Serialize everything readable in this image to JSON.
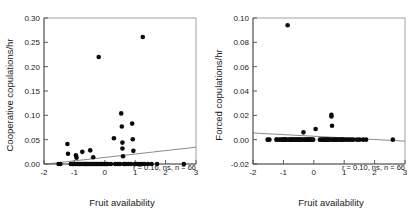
{
  "figure": {
    "background": "#ffffff",
    "point_color": "#0a0a0a",
    "line_color": "#6d6d6d",
    "frame_color": "#8a8a8a"
  },
  "chart_data": [
    {
      "type": "scatter",
      "panel": "left",
      "title": "",
      "xlabel": "Fruit availability",
      "ylabel": "Cooperative copulations/hr",
      "xlim": [
        -2,
        3
      ],
      "ylim": [
        0.0,
        0.3
      ],
      "xticks": [
        -2,
        -1,
        0,
        1,
        2,
        3
      ],
      "xticklabels": [
        "-2",
        "-1",
        "0",
        "1",
        "2",
        "3"
      ],
      "yticks": [
        0.0,
        0.05,
        0.1,
        0.15,
        0.2,
        0.25,
        0.3
      ],
      "yticklabels": [
        "0.00",
        "0.05",
        "0.10",
        "0.15",
        "0.20",
        "0.25",
        "0.30"
      ],
      "grid": false,
      "legend": null,
      "annotation": "r = 0.16, ns, n = 66",
      "annotation_stats": {
        "r": 0.16,
        "significance": "ns",
        "n": 66
      },
      "trendline": {
        "x": [
          -2.0,
          3.0
        ],
        "y": [
          -0.0005,
          0.0345
        ]
      },
      "points": [
        [
          -1.52,
          0.0
        ],
        [
          -1.46,
          0.0
        ],
        [
          -1.23,
          0.041
        ],
        [
          -1.21,
          0.021
        ],
        [
          -1.12,
          0.0
        ],
        [
          -1.06,
          0.0
        ],
        [
          -1.02,
          0.0
        ],
        [
          -0.98,
          0.0
        ],
        [
          -0.95,
          0.018
        ],
        [
          -0.93,
          0.013
        ],
        [
          -0.9,
          0.0
        ],
        [
          -0.86,
          0.0
        ],
        [
          -0.82,
          0.0
        ],
        [
          -0.78,
          0.0
        ],
        [
          -0.74,
          0.025
        ],
        [
          -0.72,
          0.0
        ],
        [
          -0.68,
          0.0
        ],
        [
          -0.64,
          0.0
        ],
        [
          -0.6,
          0.0
        ],
        [
          -0.56,
          0.0
        ],
        [
          -0.52,
          0.0
        ],
        [
          -0.48,
          0.028
        ],
        [
          -0.46,
          0.0
        ],
        [
          -0.42,
          0.0
        ],
        [
          -0.38,
          0.014
        ],
        [
          -0.36,
          0.0
        ],
        [
          -0.32,
          0.0
        ],
        [
          -0.28,
          0.0
        ],
        [
          -0.24,
          0.0
        ],
        [
          -0.2,
          0.22
        ],
        [
          -0.18,
          0.0
        ],
        [
          -0.14,
          0.0
        ],
        [
          -0.1,
          0.0
        ],
        [
          -0.06,
          0.0
        ],
        [
          -0.02,
          0.0
        ],
        [
          0.02,
          0.0
        ],
        [
          0.06,
          0.0
        ],
        [
          0.1,
          0.0
        ],
        [
          0.2,
          0.0
        ],
        [
          0.3,
          0.053
        ],
        [
          0.34,
          0.0
        ],
        [
          0.42,
          0.0
        ],
        [
          0.5,
          0.0
        ],
        [
          0.54,
          0.104
        ],
        [
          0.56,
          0.077
        ],
        [
          0.58,
          0.044
        ],
        [
          0.58,
          0.032
        ],
        [
          0.6,
          0.016
        ],
        [
          0.62,
          0.0
        ],
        [
          0.66,
          0.0
        ],
        [
          0.7,
          0.0
        ],
        [
          0.78,
          0.0
        ],
        [
          0.86,
          0.0
        ],
        [
          0.9,
          0.083
        ],
        [
          0.92,
          0.051
        ],
        [
          0.94,
          0.027
        ],
        [
          0.98,
          0.0
        ],
        [
          1.06,
          0.0
        ],
        [
          1.14,
          0.0
        ],
        [
          1.22,
          0.0
        ],
        [
          1.25,
          0.261
        ],
        [
          1.3,
          0.0
        ],
        [
          1.42,
          0.0
        ],
        [
          1.54,
          0.0
        ],
        [
          1.72,
          0.0
        ],
        [
          2.6,
          0.0
        ]
      ]
    },
    {
      "type": "scatter",
      "panel": "right",
      "title": "",
      "xlabel": "Fruit availability",
      "ylabel": "Forced copulations/hr",
      "xlim": [
        -2,
        3
      ],
      "ylim": [
        -0.02,
        0.1
      ],
      "xticks": [
        -2,
        -1,
        0,
        1,
        2,
        3
      ],
      "xticklabels": [
        "-2",
        "-1",
        "0",
        "1",
        "2",
        "3"
      ],
      "yticks": [
        -0.02,
        0.0,
        0.02,
        0.04,
        0.06,
        0.08,
        0.1
      ],
      "yticklabels": [
        "-0.02",
        "0.00",
        "0.02",
        "0.04",
        "0.06",
        "0.08",
        "0.10"
      ],
      "grid": false,
      "legend": null,
      "annotation": "r = 0.10, ns, n = 66",
      "annotation_stats": {
        "r": 0.1,
        "significance": "ns",
        "n": 66
      },
      "trendline": {
        "x": [
          -2.0,
          3.0
        ],
        "y": [
          0.0055,
          -0.0012
        ]
      },
      "points": [
        [
          -1.52,
          0.0
        ],
        [
          -1.46,
          0.0
        ],
        [
          -1.23,
          0.0
        ],
        [
          -1.21,
          0.0
        ],
        [
          -1.12,
          0.0
        ],
        [
          -1.06,
          0.0
        ],
        [
          -1.02,
          0.0
        ],
        [
          -0.98,
          0.0
        ],
        [
          -0.95,
          0.0
        ],
        [
          -0.93,
          0.0
        ],
        [
          -0.9,
          0.0
        ],
        [
          -0.86,
          0.094
        ],
        [
          -0.82,
          0.0
        ],
        [
          -0.78,
          0.0
        ],
        [
          -0.74,
          0.0
        ],
        [
          -0.72,
          0.0
        ],
        [
          -0.68,
          0.0
        ],
        [
          -0.64,
          0.0
        ],
        [
          -0.6,
          0.0
        ],
        [
          -0.56,
          0.0
        ],
        [
          -0.52,
          0.0
        ],
        [
          -0.48,
          0.0
        ],
        [
          -0.46,
          0.0
        ],
        [
          -0.42,
          0.0
        ],
        [
          -0.38,
          0.0
        ],
        [
          -0.34,
          0.006
        ],
        [
          -0.32,
          0.0
        ],
        [
          -0.28,
          0.0
        ],
        [
          -0.24,
          0.0
        ],
        [
          -0.2,
          0.0
        ],
        [
          -0.18,
          0.0
        ],
        [
          -0.14,
          0.0
        ],
        [
          -0.1,
          0.0
        ],
        [
          -0.06,
          0.0
        ],
        [
          -0.02,
          0.0
        ],
        [
          0.06,
          0.0088
        ],
        [
          0.2,
          0.0
        ],
        [
          0.26,
          0.0
        ],
        [
          0.3,
          0.0
        ],
        [
          0.34,
          0.0
        ],
        [
          0.38,
          0.0
        ],
        [
          0.42,
          0.0
        ],
        [
          0.46,
          0.0
        ],
        [
          0.5,
          0.0
        ],
        [
          0.54,
          0.0
        ],
        [
          0.58,
          0.0205
        ],
        [
          0.58,
          0.019
        ],
        [
          0.6,
          0.0115
        ],
        [
          0.62,
          0.0
        ],
        [
          0.66,
          0.0
        ],
        [
          0.7,
          0.0
        ],
        [
          0.74,
          0.0
        ],
        [
          0.78,
          0.0
        ],
        [
          0.86,
          0.0
        ],
        [
          0.94,
          0.0
        ],
        [
          0.98,
          0.0
        ],
        [
          1.06,
          0.0
        ],
        [
          1.14,
          0.0
        ],
        [
          1.22,
          0.0
        ],
        [
          1.3,
          0.0
        ],
        [
          1.42,
          0.0
        ],
        [
          1.5,
          0.0
        ],
        [
          1.62,
          0.0
        ],
        [
          1.72,
          0.0
        ],
        [
          2.6,
          0.0
        ],
        [
          0.9,
          0.0
        ]
      ]
    }
  ]
}
